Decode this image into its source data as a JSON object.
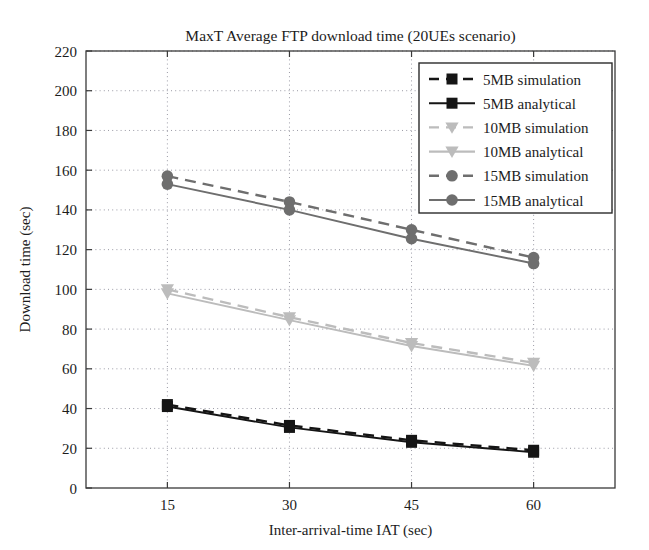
{
  "chart_data": {
    "type": "line",
    "title": "MaxT Average FTP download time (20UEs scenario)",
    "xlabel": "Inter-arrival-time IAT (sec)",
    "ylabel": "Download time (sec)",
    "x": [
      15,
      30,
      45,
      60
    ],
    "xtick_labels": [
      "15",
      "30",
      "45",
      "60"
    ],
    "xlim": [
      5,
      70
    ],
    "ylim": [
      0,
      220
    ],
    "ytick_labels": [
      "0",
      "20",
      "40",
      "60",
      "80",
      "100",
      "120",
      "140",
      "160",
      "180",
      "200",
      "220"
    ],
    "yticks": [
      0,
      20,
      40,
      60,
      80,
      100,
      120,
      140,
      160,
      180,
      200,
      220
    ],
    "grid": true,
    "legend_position": "upper right",
    "series": [
      {
        "name": "5MB simulation",
        "values": [
          42,
          31.5,
          24,
          19
        ],
        "color": "#151515",
        "style": "dashed",
        "marker": "square"
      },
      {
        "name": "5MB analytical",
        "values": [
          41,
          30.5,
          23,
          18
        ],
        "color": "#151515",
        "style": "solid",
        "marker": "square"
      },
      {
        "name": "10MB simulation",
        "values": [
          100,
          86,
          73,
          63
        ],
        "color": "#bcbcbc",
        "style": "dashed",
        "marker": "triangle-down"
      },
      {
        "name": "10MB analytical",
        "values": [
          98,
          84.5,
          71.5,
          61.5
        ],
        "color": "#bcbcbc",
        "style": "solid",
        "marker": "triangle-down"
      },
      {
        "name": "15MB simulation",
        "values": [
          157,
          144,
          130,
          116
        ],
        "color": "#6e6e6e",
        "style": "dashed",
        "marker": "circle"
      },
      {
        "name": "15MB analytical",
        "values": [
          153,
          140,
          125.5,
          113
        ],
        "color": "#6e6e6e",
        "style": "solid",
        "marker": "circle"
      }
    ]
  }
}
